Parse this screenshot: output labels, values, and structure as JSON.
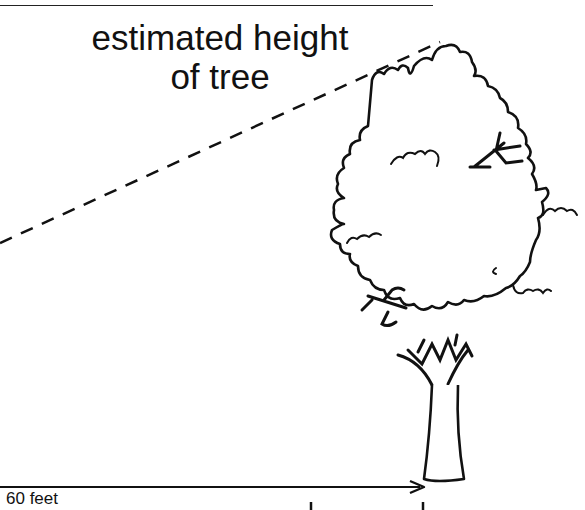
{
  "diagram": {
    "title_line1": "estimated height",
    "title_line2": "of tree",
    "distance_label": "60 feet",
    "elements": [
      "top-rule",
      "dashed-sightline",
      "tree",
      "ground-arrow"
    ],
    "colors": {
      "ink": "#111111",
      "background": "#ffffff"
    }
  }
}
